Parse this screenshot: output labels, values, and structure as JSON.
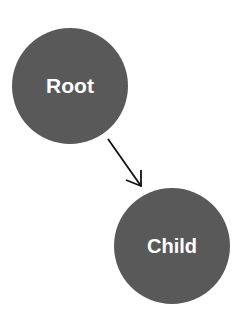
{
  "diagram": {
    "type": "tree",
    "nodes": [
      {
        "id": "root",
        "label": "Root",
        "cx": 70,
        "cy": 86,
        "r": 58
      },
      {
        "id": "child",
        "label": "Child",
        "cx": 172,
        "cy": 246,
        "r": 58
      }
    ],
    "edges": [
      {
        "from": "root",
        "to": "child",
        "directed": true
      }
    ],
    "colors": {
      "node_fill": "#595959",
      "node_text": "#ffffff",
      "edge": "#111111",
      "background": "#ffffff"
    }
  }
}
